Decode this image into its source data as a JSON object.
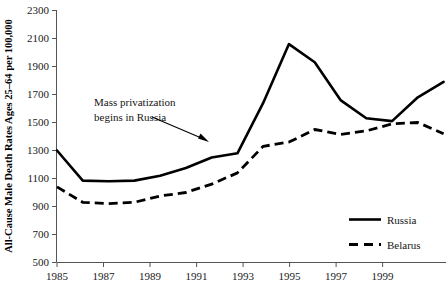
{
  "chart_data": {
    "type": "line",
    "title": "",
    "xlabel": "",
    "ylabel": "All-Cause Male Death Rates Ages 25–64 per 100,000",
    "xlim": [
      1985,
      2000
    ],
    "ylim": [
      500,
      2300
    ],
    "grid": false,
    "legend_position": "bottom-right",
    "x": [
      1985,
      1986,
      1987,
      1988,
      1989,
      1990,
      1991,
      1992,
      1993,
      1994,
      1995,
      1996,
      1997,
      1998,
      1999,
      2000
    ],
    "xticks": [
      "1985",
      "1987",
      "1989",
      "1991",
      "1993",
      "1995",
      "1997",
      "1999"
    ],
    "xtick_values": [
      1985,
      1987,
      1989,
      1991,
      1993,
      1995,
      1997,
      1999
    ],
    "yticks": [
      "500",
      "700",
      "900",
      "1100",
      "1300",
      "1500",
      "1700",
      "1900",
      "2100",
      "2300"
    ],
    "ytick_values": [
      500,
      700,
      900,
      1100,
      1300,
      1500,
      1700,
      1900,
      2100,
      2300
    ],
    "series": [
      {
        "name": "Russia",
        "style": "solid",
        "color": "#000000",
        "values": [
          1300,
          1085,
          1080,
          1085,
          1120,
          1175,
          1250,
          1280,
          1640,
          2060,
          1930,
          1660,
          1530,
          1510,
          1680,
          1790
        ]
      },
      {
        "name": "Belarus",
        "style": "dashed",
        "color": "#000000",
        "values": [
          1040,
          930,
          920,
          930,
          975,
          1000,
          1060,
          1140,
          1330,
          1360,
          1450,
          1415,
          1440,
          1490,
          1500,
          1420
        ]
      }
    ],
    "annotations": [
      {
        "id": "mass-privatization",
        "line1": "Mass privatization",
        "line2": "begins in Russia",
        "arrow_target_x": 1992,
        "arrow_target_y": 1330
      }
    ]
  },
  "legend": {
    "items": [
      {
        "label": "Russia",
        "style": "solid"
      },
      {
        "label": "Belarus",
        "style": "dashed"
      }
    ]
  }
}
